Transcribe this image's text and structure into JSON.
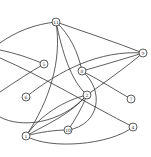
{
  "diagram": {
    "type": "undirected-graph",
    "colors": {
      "stroke": "#333333",
      "background": "#ffffff",
      "node_fill": "#ffffff"
    },
    "nodes": [
      {
        "id": "11",
        "label": "11",
        "x": 56,
        "y": 22
      },
      {
        "id": "9",
        "label": "9",
        "x": 143,
        "y": 53
      },
      {
        "id": "5",
        "label": "5",
        "x": 44,
        "y": 64
      },
      {
        "id": "8",
        "label": "8",
        "x": 82,
        "y": 71
      },
      {
        "id": "6",
        "label": "6",
        "x": 26,
        "y": 97
      },
      {
        "id": "2",
        "label": "2",
        "x": 87,
        "y": 95
      },
      {
        "id": "7",
        "label": "7",
        "x": 131,
        "y": 99
      },
      {
        "id": "10",
        "label": "10",
        "x": 68,
        "y": 130
      },
      {
        "id": "4",
        "label": "4",
        "x": 133,
        "y": 127
      },
      {
        "id": "1",
        "label": "1",
        "x": 26,
        "y": 136
      }
    ],
    "edges": [
      {
        "from": "11",
        "to": "offscreen-left-a"
      },
      {
        "from": "11",
        "to": "9"
      },
      {
        "from": "11",
        "to": "1"
      },
      {
        "from": "11",
        "to": "2"
      },
      {
        "from": "11",
        "to": "8"
      },
      {
        "from": "5",
        "to": "offscreen-left-b"
      },
      {
        "from": "4",
        "to": "offscreen-left-c"
      },
      {
        "from": "5",
        "to": "offscreen-left-d"
      },
      {
        "from": "6",
        "to": "9"
      },
      {
        "from": "9",
        "to": "8"
      },
      {
        "from": "9",
        "to": "2"
      },
      {
        "from": "8",
        "to": "7"
      },
      {
        "from": "8",
        "to": "10"
      },
      {
        "from": "2",
        "to": "1"
      },
      {
        "from": "2",
        "to": "10"
      },
      {
        "from": "1",
        "to": "10"
      },
      {
        "from": "1",
        "to": "4"
      },
      {
        "from": "2",
        "to": "offscreen-left-e"
      }
    ]
  }
}
